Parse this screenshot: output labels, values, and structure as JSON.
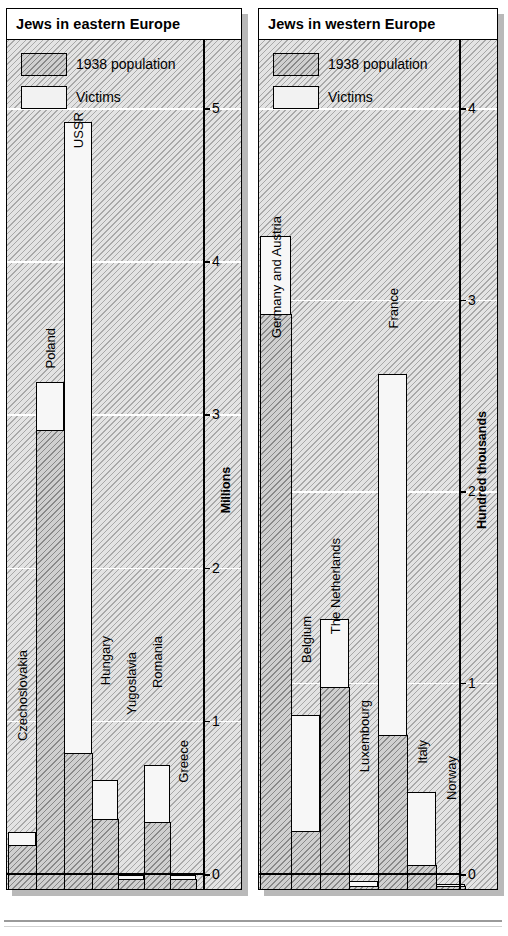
{
  "figure": {
    "bottom_rule": "horizontal-rule"
  },
  "legend_items": [
    {
      "key": "population",
      "label": "1938 population",
      "style": "hatched"
    },
    {
      "key": "victims",
      "label": "Victims",
      "style": "plain"
    }
  ],
  "panels": [
    {
      "id": "east",
      "title": "Jews in eastern Europe",
      "axis_title": "Millions",
      "legend": [
        {
          "label": "1938 population"
        },
        {
          "label": "Victims"
        }
      ],
      "ticks": [
        "0",
        "1",
        "2",
        "3",
        "4",
        "5"
      ]
    },
    {
      "id": "west",
      "title": "Jews in western Europe",
      "axis_title": "Hundred thousands",
      "legend": [
        {
          "label": "1938 population"
        },
        {
          "label": "Victims"
        }
      ],
      "ticks": [
        "0",
        "1",
        "2",
        "3",
        "4"
      ]
    }
  ],
  "chart_data": [
    {
      "type": "bar",
      "title": "Jews in eastern Europe",
      "xlabel": "",
      "ylabel": "Millions",
      "ylim": [
        0,
        5
      ],
      "yticks": [
        0,
        1,
        2,
        3,
        4,
        5
      ],
      "grid": true,
      "legend": [
        "1938 population",
        "Victims"
      ],
      "legend_position": "top-left",
      "categories": [
        "Czechoslovakia",
        "Poland",
        "USSR",
        "Hungary",
        "Yugoslavia",
        "Romania",
        "Greece"
      ],
      "series": [
        {
          "name": "1938 population",
          "values": [
            0.36,
            3.3,
            5.0,
            0.7,
            0.08,
            0.8,
            0.08
          ]
        },
        {
          "name": "Victims",
          "values": [
            0.28,
            2.99,
            0.88,
            0.45,
            0.06,
            0.43,
            0.06
          ]
        }
      ]
    },
    {
      "type": "bar",
      "title": "Jews in western Europe",
      "xlabel": "",
      "ylabel": "Hundred thousands",
      "ylim": [
        0,
        4
      ],
      "yticks": [
        0,
        1,
        2,
        3,
        4
      ],
      "grid": true,
      "legend": [
        "1938 population",
        "Victims"
      ],
      "legend_position": "top-left",
      "categories": [
        "Germany and Austria",
        "Belgium",
        "The Netherlands",
        "Luxembourg",
        "France",
        "Italy",
        "Norway"
      ],
      "series": [
        {
          "name": "1938 population",
          "values": [
            3.4,
            0.9,
            1.4,
            0.035,
            2.68,
            0.5,
            0.018
          ]
        },
        {
          "name": "Victims",
          "values": [
            3.0,
            0.3,
            1.05,
            0.012,
            0.8,
            0.12,
            0.009
          ]
        }
      ]
    }
  ]
}
